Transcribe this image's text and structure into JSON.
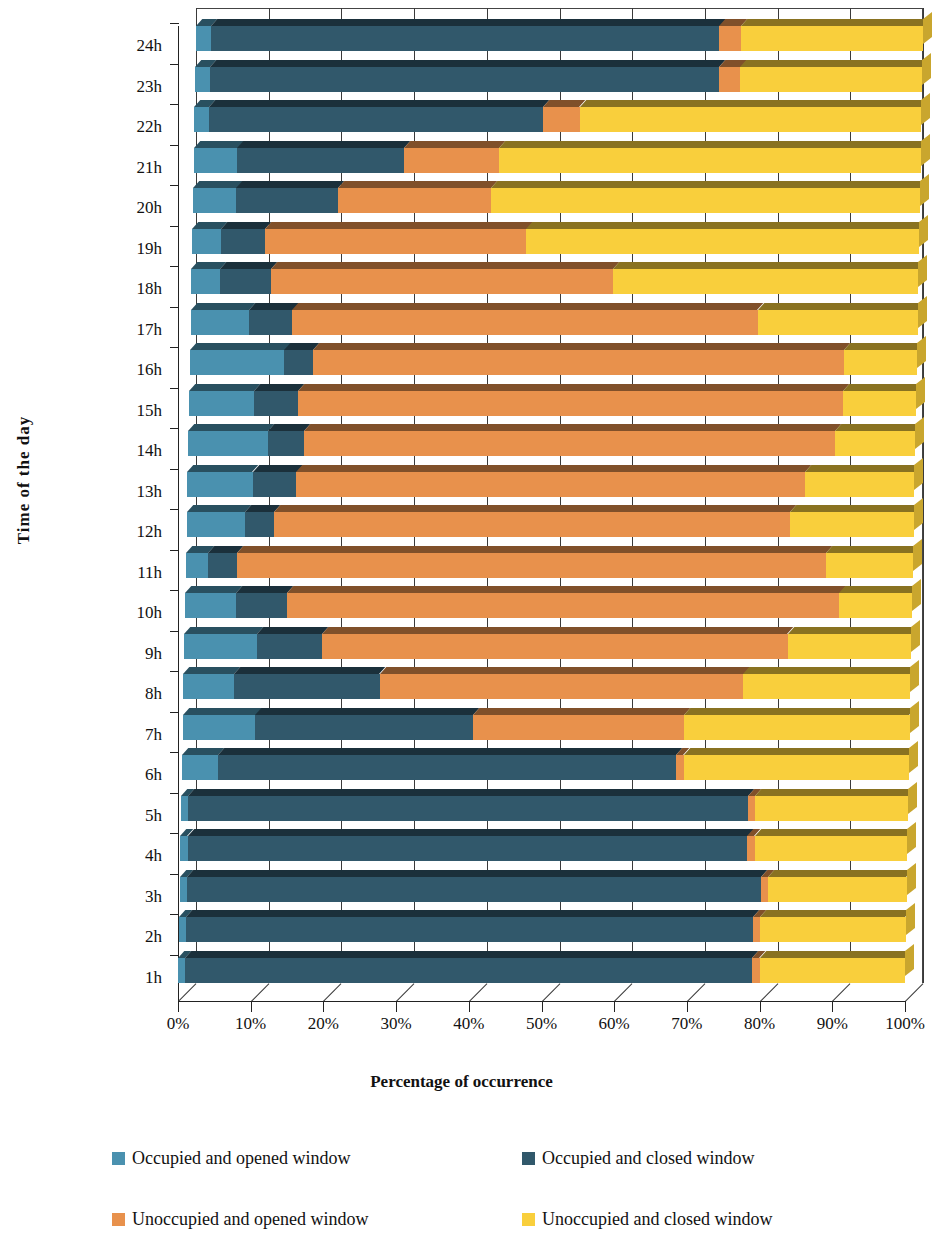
{
  "axes": {
    "y_title": "Time of the day",
    "x_title": "Percentage of occurrence",
    "x_ticks": [
      "0%",
      "10%",
      "20%",
      "30%",
      "40%",
      "50%",
      "60%",
      "70%",
      "80%",
      "90%",
      "100%"
    ],
    "y_ticks": [
      "24h",
      "23h",
      "22h",
      "21h",
      "20h",
      "19h",
      "18h",
      "17h",
      "16h",
      "15h",
      "14h",
      "13h",
      "12h",
      "11h",
      "10h",
      "9h",
      "8h",
      "7h",
      "6h",
      "5h",
      "4h",
      "3h",
      "2h",
      "1h"
    ]
  },
  "legend": {
    "items": [
      {
        "label": "Occupied and opened window",
        "color": "#4a91af",
        "key": "occupied_opened"
      },
      {
        "label": "Occupied and closed window",
        "color": "#31586b",
        "key": "occupied_closed"
      },
      {
        "label": "Unoccupied and opened window",
        "color": "#e8914c",
        "key": "unoccupied_opened"
      },
      {
        "label": "Unoccupied and closed window",
        "color": "#f9cf3c",
        "key": "unoccupied_closed"
      }
    ]
  },
  "chart_data": {
    "type": "bar",
    "orientation": "horizontal",
    "stacked": true,
    "normalized": true,
    "title": "",
    "xlabel": "Percentage of occurrence",
    "ylabel": "Time of the day",
    "xlim": [
      0,
      100
    ],
    "xticks": [
      0,
      10,
      20,
      30,
      40,
      50,
      60,
      70,
      80,
      90,
      100
    ],
    "grid": true,
    "legend_position": "bottom",
    "categories": [
      "1h",
      "2h",
      "3h",
      "4h",
      "5h",
      "6h",
      "7h",
      "8h",
      "9h",
      "10h",
      "11h",
      "12h",
      "13h",
      "14h",
      "15h",
      "16h",
      "17h",
      "18h",
      "19h",
      "20h",
      "21h",
      "22h",
      "23h",
      "24h"
    ],
    "series": [
      {
        "name": "Occupied and opened window",
        "color": "#4a91af",
        "values": [
          1,
          1,
          1,
          1,
          1,
          5,
          10,
          7,
          10,
          7,
          3,
          8,
          9,
          11,
          9,
          13,
          8,
          4,
          4,
          6,
          6,
          2,
          2,
          2
        ]
      },
      {
        "name": "Occupied and closed window",
        "color": "#31586b",
        "values": [
          78,
          78,
          79,
          77,
          77,
          63,
          30,
          20,
          9,
          7,
          4,
          4,
          6,
          5,
          6,
          4,
          6,
          7,
          6,
          14,
          23,
          46,
          70,
          70
        ]
      },
      {
        "name": "Unoccupied and opened window",
        "color": "#e8914c",
        "values": [
          1,
          1,
          1,
          1,
          1,
          1,
          29,
          50,
          64,
          76,
          81,
          71,
          70,
          73,
          75,
          73,
          64,
          47,
          36,
          21,
          13,
          5,
          3,
          3
        ]
      },
      {
        "name": "Unoccupied and closed window",
        "color": "#f9cf3c",
        "values": [
          20,
          20,
          19,
          21,
          21,
          31,
          31,
          23,
          17,
          10,
          12,
          17,
          15,
          11,
          10,
          10,
          22,
          42,
          54,
          59,
          58,
          47,
          25,
          25
        ]
      }
    ]
  }
}
